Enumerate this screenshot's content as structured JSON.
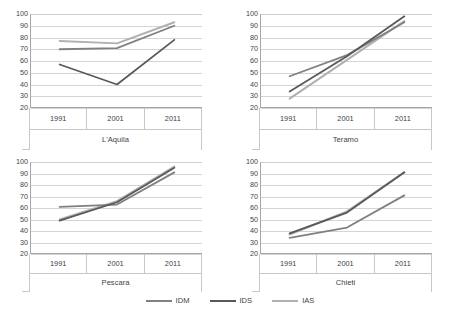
{
  "chart_data": {
    "type": "line",
    "title": "",
    "xlabel": "",
    "ylabel": "",
    "ylim": [
      20,
      100
    ],
    "ytick_step": 10,
    "yticks": [
      100,
      90,
      80,
      70,
      60,
      50,
      40,
      30,
      20
    ],
    "categories": [
      "1991",
      "2001",
      "2011"
    ],
    "grid": true,
    "legend_position": "bottom",
    "legend": [
      "IDM",
      "IDS",
      "IAS"
    ],
    "series_colors": {
      "IDM": "#808080",
      "IDS": "#595959",
      "IAS": "#b0b0b0"
    },
    "panels": [
      {
        "title": "L'Aquila",
        "series": [
          {
            "name": "IDM",
            "values": [
              70,
              71,
              90
            ]
          },
          {
            "name": "IDS",
            "values": [
              57,
              40,
              78
            ]
          },
          {
            "name": "IAS",
            "values": [
              77,
              75,
              93
            ]
          }
        ]
      },
      {
        "title": "Teramo",
        "series": [
          {
            "name": "IDM",
            "values": [
              47,
              65,
              93
            ]
          },
          {
            "name": "IDS",
            "values": [
              34,
              64,
              98
            ]
          },
          {
            "name": "IAS",
            "values": [
              28,
              61,
              94
            ]
          }
        ]
      },
      {
        "title": "Pescara",
        "series": [
          {
            "name": "IDM",
            "values": [
              61,
              63,
              91
            ]
          },
          {
            "name": "IDS",
            "values": [
              49,
              65,
              95
            ]
          },
          {
            "name": "IAS",
            "values": [
              50,
              66,
              96
            ]
          }
        ]
      },
      {
        "title": "Chieti",
        "series": [
          {
            "name": "IDM",
            "values": [
              34,
              43,
              71
            ]
          },
          {
            "name": "IDS",
            "values": [
              38,
              56,
              91
            ]
          },
          {
            "name": "IAS",
            "values": [
              37,
              57,
              91
            ]
          }
        ]
      }
    ]
  }
}
